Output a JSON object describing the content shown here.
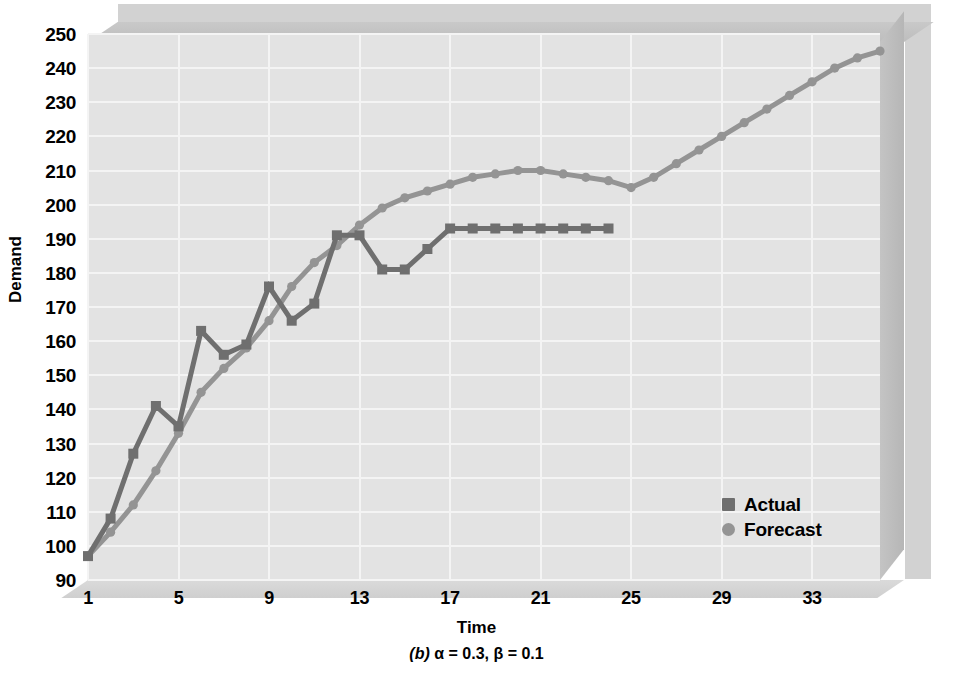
{
  "chart_data": {
    "type": "line",
    "title": "",
    "caption": "(b) α = 0.3, β = 0.1",
    "caption_label": "(b)",
    "caption_params": "α = 0.3, β = 0.1",
    "xlabel": "Time",
    "ylabel": "Demand",
    "xlim": [
      1,
      36
    ],
    "ylim": [
      90,
      250
    ],
    "xticks": [
      1,
      5,
      9,
      13,
      17,
      21,
      25,
      29,
      33
    ],
    "yticks": [
      90,
      100,
      110,
      120,
      130,
      140,
      150,
      160,
      170,
      180,
      190,
      200,
      210,
      220,
      230,
      240,
      250
    ],
    "grid": true,
    "legend_position": "inside-right",
    "colors": {
      "actual": "#6f6f6f",
      "forecast": "#949494",
      "plot_background": "#e3e3e3",
      "gridline": "#f4f4f4",
      "frame": "#c2c2c2"
    },
    "series": [
      {
        "name": "Actual",
        "marker": "square",
        "color": "#6f6f6f",
        "x": [
          1,
          2,
          3,
          4,
          5,
          6,
          7,
          8,
          9,
          10,
          11,
          12,
          13,
          14,
          15,
          16,
          17,
          18,
          19,
          20,
          21,
          22,
          23,
          24
        ],
        "values": [
          97,
          108,
          127,
          141,
          135,
          163,
          156,
          159,
          176,
          166,
          171,
          191,
          191,
          181,
          181,
          187,
          193,
          193,
          193,
          193,
          193,
          193,
          193,
          193
        ]
      },
      {
        "name": "Forecast",
        "marker": "circle",
        "color": "#949494",
        "x": [
          1,
          2,
          3,
          4,
          5,
          6,
          7,
          8,
          9,
          10,
          11,
          12,
          13,
          14,
          15,
          16,
          17,
          18,
          19,
          20,
          21,
          22,
          23,
          24,
          25,
          26,
          27,
          28,
          29,
          30,
          31,
          32,
          33,
          34,
          35,
          36
        ],
        "values": [
          97,
          104,
          112,
          122,
          133,
          145,
          152,
          158,
          166,
          176,
          183,
          188,
          194,
          199,
          202,
          204,
          206,
          208,
          209,
          210,
          210,
          209,
          208,
          207,
          205,
          208,
          212,
          216,
          220,
          224,
          228,
          232,
          236,
          240,
          243,
          245
        ]
      }
    ]
  },
  "legend": {
    "items": [
      {
        "label": "Actual",
        "marker": "square",
        "color": "#6f6f6f"
      },
      {
        "label": "Forecast",
        "marker": "circle",
        "color": "#949494"
      }
    ]
  }
}
